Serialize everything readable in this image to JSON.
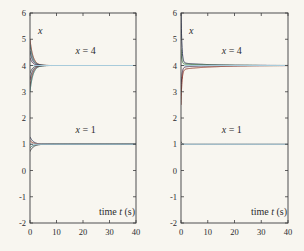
{
  "figure": {
    "background": "#f8f6f0",
    "axis_color": "#3c3c3e",
    "tick_label_color": "#2c2c2e",
    "equilibrium_line_color": "#a8cbdb",
    "model_note": "trajectories follow x(t) = eq + a1*exp(-r1*t) + a2*exp(-r2*t)"
  },
  "chart_data": [
    {
      "type": "line",
      "panel": "left",
      "title": "",
      "xlabel": "time t (s)",
      "ylabel": "x",
      "xlim": [
        0,
        40
      ],
      "ylim": [
        -2,
        6
      ],
      "xticks": [
        0,
        10,
        20,
        30,
        40
      ],
      "yticks": [
        6,
        5,
        4,
        3,
        2,
        1,
        0,
        -1,
        -2
      ],
      "grid": false,
      "legend": null,
      "equilibria": [
        4,
        1
      ],
      "annotations": [
        {
          "text": "x = 4",
          "t": 21,
          "x": 4.42
        },
        {
          "text": "x = 1",
          "t": 21,
          "x": 1.42
        }
      ],
      "series": [
        {
          "name": "x0-5.0",
          "eq": 4,
          "a1": 1.0,
          "r1": 0.9,
          "a2": 0,
          "r2": 1,
          "color": "#8a3020"
        },
        {
          "name": "x0-4.8",
          "eq": 4,
          "a1": 0.8,
          "r1": 0.95,
          "a2": 0,
          "r2": 1,
          "color": "#2e6f6f"
        },
        {
          "name": "x0-4.55",
          "eq": 4,
          "a1": 0.55,
          "r1": 1.0,
          "a2": 0,
          "r2": 1,
          "color": "#232c4e"
        },
        {
          "name": "x0-4.3",
          "eq": 4,
          "a1": 0.3,
          "r1": 1.05,
          "a2": 0,
          "r2": 1,
          "color": "#44284a"
        },
        {
          "name": "x0-3.7",
          "eq": 4,
          "a1": -0.3,
          "r1": 1.05,
          "a2": 0,
          "r2": 1,
          "color": "#33353a"
        },
        {
          "name": "x0-3.45",
          "eq": 4,
          "a1": -0.55,
          "r1": 1.0,
          "a2": 0,
          "r2": 1,
          "color": "#232c4e"
        },
        {
          "name": "x0-3.2",
          "eq": 4,
          "a1": -0.8,
          "r1": 0.95,
          "a2": 0,
          "r2": 1,
          "color": "#8a3020"
        },
        {
          "name": "x0-3.0",
          "eq": 4,
          "a1": -1.0,
          "r1": 0.9,
          "a2": 0,
          "r2": 1,
          "color": "#2e6f6f"
        },
        {
          "name": "x0-1.28",
          "eq": 1,
          "a1": 0.28,
          "r1": 0.8,
          "a2": 0,
          "r2": 1,
          "color": "#232c4e"
        },
        {
          "name": "x0-1.14",
          "eq": 1,
          "a1": 0.14,
          "r1": 0.85,
          "a2": 0,
          "r2": 1,
          "color": "#8a3020"
        },
        {
          "name": "x0-0.86",
          "eq": 1,
          "a1": -0.14,
          "r1": 0.85,
          "a2": 0,
          "r2": 1,
          "color": "#2e6f6f"
        },
        {
          "name": "x0-0.72",
          "eq": 1,
          "a1": -0.28,
          "r1": 0.8,
          "a2": 0,
          "r2": 1,
          "color": "#33353a"
        }
      ]
    },
    {
      "type": "line",
      "panel": "right",
      "title": "",
      "xlabel": "time t (s)",
      "ylabel": "x",
      "xlim": [
        0,
        40
      ],
      "ylim": [
        -2,
        6
      ],
      "xticks": [
        0,
        10,
        20,
        30,
        40
      ],
      "yticks": [
        6,
        5,
        4,
        3,
        2,
        1,
        0,
        -1,
        -2
      ],
      "grid": false,
      "legend": null,
      "equilibria": [
        4,
        1
      ],
      "annotations": [
        {
          "text": "x = 4",
          "t": 19,
          "x": 4.42
        },
        {
          "text": "x = 1",
          "t": 19,
          "x": 1.42
        }
      ],
      "series": [
        {
          "name": "x0-6.2",
          "eq": 4,
          "a1": 2.1,
          "r1": 3.2,
          "a2": 0.1,
          "r2": 0.1,
          "color": "#232c4e"
        },
        {
          "name": "x0-4.6",
          "eq": 4,
          "a1": 0.55,
          "r1": 3.5,
          "a2": 0.06,
          "r2": 0.12,
          "color": "#3e7a44"
        },
        {
          "name": "x0-3.05",
          "eq": 4,
          "a1": -0.9,
          "r1": 3.0,
          "a2": -0.06,
          "r2": 0.13,
          "color": "#44284a"
        },
        {
          "name": "x0-2.5",
          "eq": 4,
          "a1": -1.35,
          "r1": 2.8,
          "a2": -0.15,
          "r2": 0.09,
          "color": "#8a3020"
        },
        {
          "name": "x0-1.1",
          "eq": 1,
          "a1": 0.1,
          "r1": 2.5,
          "a2": 0,
          "r2": 1,
          "color": "#33353a"
        }
      ]
    }
  ]
}
